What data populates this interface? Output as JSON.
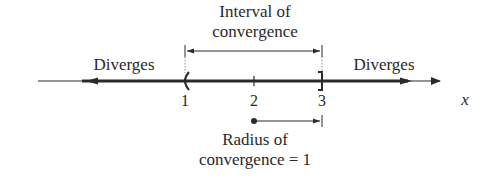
{
  "diagram": {
    "type": "number-line",
    "title_top": {
      "line1": "Interval of",
      "line2": "convergence"
    },
    "left_region_label": "Diverges",
    "right_region_label": "Diverges",
    "axis_variable": "x",
    "ticks": [
      {
        "value": "1",
        "marker": "(",
        "meaning": "open endpoint"
      },
      {
        "value": "2",
        "marker": "+",
        "meaning": "center"
      },
      {
        "value": "3",
        "marker": "]",
        "meaning": "closed endpoint"
      }
    ],
    "radius_label": {
      "line1": "Radius of",
      "line2": "convergence = 1"
    },
    "colors": {
      "ink": "#2a2a2a",
      "background": "#ffffff"
    }
  }
}
